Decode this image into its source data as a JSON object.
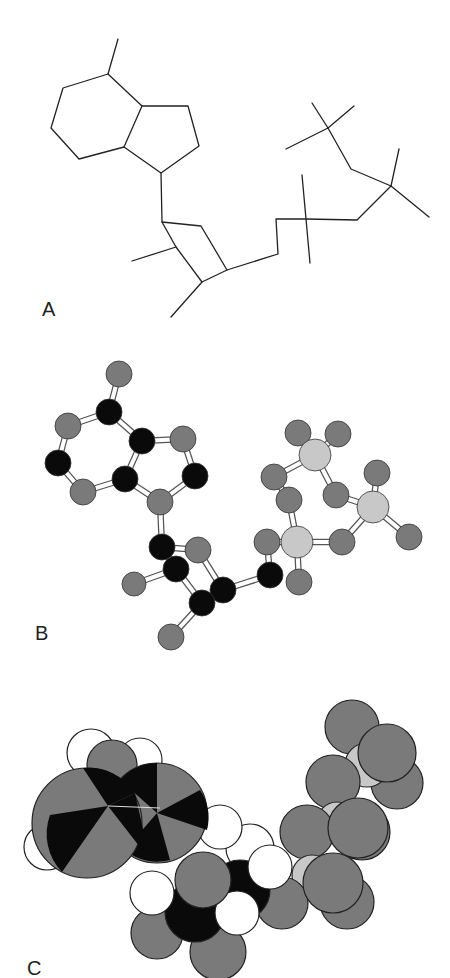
{
  "figure": {
    "panels": [
      {
        "id": "A",
        "label": "A",
        "style": "line (stick) structure"
      },
      {
        "id": "B",
        "label": "B",
        "style": "ball-and-stick model"
      },
      {
        "id": "C",
        "label": "C",
        "style": "space-filling model"
      }
    ],
    "colors": {
      "background": "#ffffff",
      "line": "#222222",
      "atom_black": "#0a0a0a",
      "atom_gray": "#7a7a7a",
      "atom_light": "#c8c8c8",
      "atom_white": "#ffffff"
    }
  }
}
